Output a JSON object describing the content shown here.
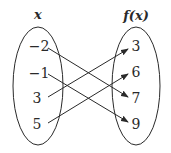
{
  "domain_headers": {
    "left": "x",
    "right": "f(x)"
  },
  "domain": {
    "values": [
      "−2",
      "−1",
      "3",
      "5"
    ]
  },
  "range": {
    "values": [
      "3",
      "6",
      "7",
      "9"
    ]
  },
  "mappings": [
    {
      "from": "−2",
      "to": "7"
    },
    {
      "from": "−1",
      "to": "9"
    },
    {
      "from": "3",
      "to": "3"
    },
    {
      "from": "5",
      "to": "6"
    }
  ],
  "colors": {
    "stroke": "#2a2a2a",
    "background": "#ffffff"
  }
}
